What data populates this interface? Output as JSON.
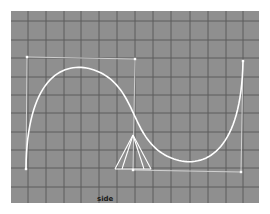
{
  "viewport": {
    "name": "side",
    "label": "side",
    "colors": {
      "background": "#8f8f8f",
      "grid_line": "#5c5c5c",
      "curve": "#ffffff",
      "hull": "#d8d8d8",
      "cv": "#ffffff",
      "camera": "#ffffff"
    },
    "grid": {
      "vertical_x": [
        17,
        35,
        53,
        70,
        88,
        106,
        124,
        142,
        160,
        179,
        197,
        215,
        232
      ],
      "horizontal_y": [
        10,
        29,
        47,
        66,
        84,
        102,
        121,
        139,
        157,
        176
      ]
    },
    "curve": {
      "type": "nurbs-curve",
      "control_vertices": [
        {
          "x": 15,
          "y": 158
        },
        {
          "x": 16,
          "y": 46
        },
        {
          "x": 124,
          "y": 48
        },
        {
          "x": 122,
          "y": 159
        },
        {
          "x": 230,
          "y": 161
        },
        {
          "x": 232,
          "y": 50
        }
      ]
    },
    "camera_icon": {
      "apex": {
        "x": 122,
        "y": 124
      },
      "base_left": {
        "x": 104,
        "y": 158
      },
      "base_right": {
        "x": 140,
        "y": 158
      },
      "inner_left": {
        "x": 111,
        "y": 158
      },
      "inner_right": {
        "x": 133,
        "y": 158
      }
    }
  }
}
